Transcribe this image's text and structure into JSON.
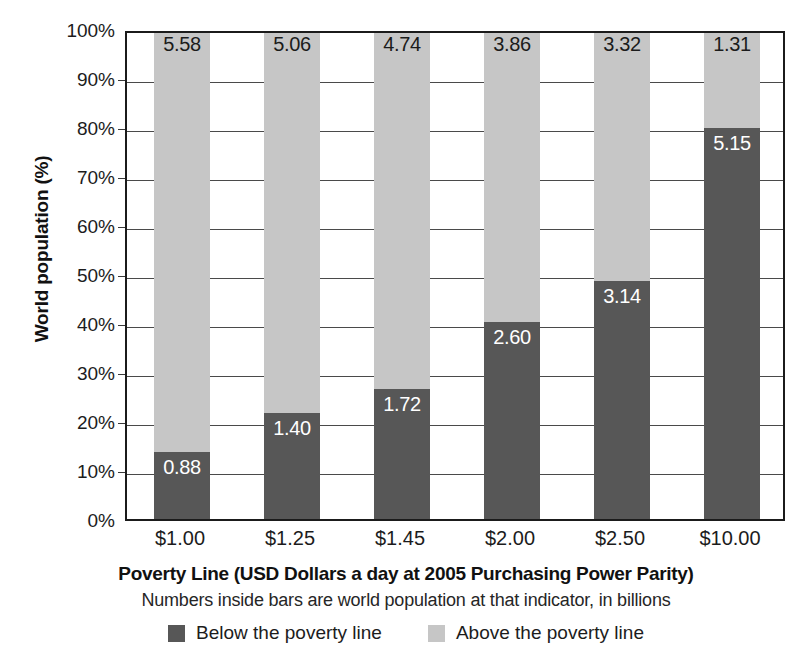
{
  "chart_data": {
    "type": "bar",
    "subtype": "stacked-bar-100",
    "title": "",
    "xlabel": "Poverty Line (USD Dollars a day at 2005 Purchasing Power Parity)",
    "ylabel": "World population (%)",
    "subcaption": "Numbers inside bars are world population at that indicator, in billions",
    "categories": [
      "$1.00",
      "$1.25",
      "$1.45",
      "$2.00",
      "$2.50",
      "$10.00"
    ],
    "ylim": [
      0,
      100
    ],
    "yticks": [
      "0%",
      "10%",
      "20%",
      "30%",
      "40%",
      "50%",
      "60%",
      "70%",
      "80%",
      "90%",
      "100%"
    ],
    "ytick_values": [
      0,
      10,
      20,
      30,
      40,
      50,
      60,
      70,
      80,
      90,
      100
    ],
    "grid": true,
    "legend_position": "bottom",
    "value_unit": "billions of people",
    "series": [
      {
        "name": "Below the poverty line",
        "color": "#575757",
        "values": [
          0.88,
          1.4,
          1.72,
          2.6,
          3.14,
          5.15
        ],
        "labels": [
          "0.88",
          "1.40",
          "1.72",
          "2.60",
          "3.14",
          "5.15"
        ],
        "percent_of_total": [
          13.6,
          21.7,
          26.6,
          40.2,
          48.6,
          79.7
        ]
      },
      {
        "name": "Above the poverty line",
        "color": "#c6c6c6",
        "values": [
          5.58,
          5.06,
          4.74,
          3.86,
          3.32,
          1.31
        ],
        "labels": [
          "5.58",
          "5.06",
          "4.74",
          "3.86",
          "3.32",
          "1.31"
        ],
        "percent_of_total": [
          86.4,
          78.3,
          73.4,
          59.8,
          51.4,
          20.3
        ]
      }
    ]
  },
  "legend": {
    "items": [
      {
        "label": "Below the poverty line",
        "swatch": "below"
      },
      {
        "label": "Above the poverty line",
        "swatch": "above"
      }
    ]
  },
  "colors": {
    "below": "#575757",
    "above": "#c6c6c6",
    "axis": "#1b1b1b",
    "grid": "#4a4a4a",
    "background": "#ffffff"
  }
}
